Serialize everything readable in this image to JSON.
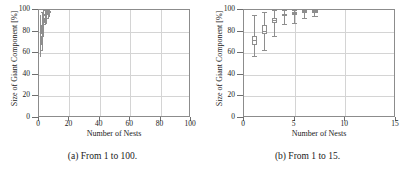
{
  "figure": {
    "panels": [
      {
        "id": "panel-a",
        "caption": "(a) From 1 to 100.",
        "chart_data": {
          "type": "box",
          "title": "",
          "xlabel": "Number of Nests",
          "ylabel": "Size of Giant Component [%]",
          "xlim": [
            0,
            100
          ],
          "ylim": [
            0,
            100
          ],
          "xticks": [
            0,
            20,
            40,
            60,
            80,
            100
          ],
          "xticklabels": [
            "0",
            "20",
            "40",
            "60",
            "80",
            "100"
          ],
          "yticks": [
            0,
            20,
            40,
            60,
            80,
            100
          ],
          "yticklabels": [
            "0",
            "20",
            "40",
            "60",
            "80",
            "100"
          ],
          "grid": true,
          "legend": "none",
          "boxes": [
            {
              "x": 1,
              "whisker_low": 57,
              "q1": 68,
              "median": 72,
              "q3": 76,
              "whisker_high": 95
            },
            {
              "x": 2,
              "whisker_low": 63,
              "q1": 78,
              "median": 81,
              "q3": 86,
              "whisker_high": 98
            },
            {
              "x": 3,
              "whisker_low": 76,
              "q1": 88,
              "median": 91,
              "q3": 93,
              "whisker_high": 100
            },
            {
              "x": 4,
              "whisker_low": 87,
              "q1": 94,
              "median": 95,
              "q3": 96,
              "whisker_high": 100
            },
            {
              "x": 5,
              "whisker_low": 88,
              "q1": 95,
              "median": 97,
              "q3": 98,
              "whisker_high": 100
            },
            {
              "x": 6,
              "whisker_low": 93,
              "q1": 97,
              "median": 98,
              "q3": 99,
              "whisker_high": 100
            },
            {
              "x": 7,
              "whisker_low": 94,
              "q1": 98,
              "median": 98,
              "q3": 99,
              "whisker_high": 100
            }
          ]
        }
      },
      {
        "id": "panel-b",
        "caption": "(b) From 1 to 15.",
        "chart_data": {
          "type": "box",
          "title": "",
          "xlabel": "Number of Nests",
          "ylabel": "Size of Giant Component [%]",
          "xlim": [
            0,
            15
          ],
          "ylim": [
            0,
            100
          ],
          "xticks": [
            0,
            5,
            10,
            15
          ],
          "xticklabels": [
            "0",
            "5",
            "10",
            "15"
          ],
          "yticks": [
            0,
            20,
            40,
            60,
            80,
            100
          ],
          "yticklabels": [
            "0",
            "20",
            "40",
            "60",
            "80",
            "100"
          ],
          "grid": true,
          "legend": "none",
          "boxes": [
            {
              "x": 1,
              "whisker_low": 57,
              "q1": 68,
              "median": 72,
              "q3": 76,
              "whisker_high": 95
            },
            {
              "x": 2,
              "whisker_low": 63,
              "q1": 78,
              "median": 81,
              "q3": 86,
              "whisker_high": 98
            },
            {
              "x": 3,
              "whisker_low": 76,
              "q1": 88,
              "median": 91,
              "q3": 93,
              "whisker_high": 100
            },
            {
              "x": 4,
              "whisker_low": 87,
              "q1": 94,
              "median": 95,
              "q3": 96,
              "whisker_high": 100
            },
            {
              "x": 5,
              "whisker_low": 88,
              "q1": 95,
              "median": 97,
              "q3": 98,
              "whisker_high": 100
            },
            {
              "x": 6,
              "whisker_low": 93,
              "q1": 97,
              "median": 98,
              "q3": 99,
              "whisker_high": 100
            },
            {
              "x": 7,
              "whisker_low": 94,
              "q1": 98,
              "median": 98,
              "q3": 99,
              "whisker_high": 100
            }
          ]
        }
      }
    ],
    "style": {
      "box_color": "#8e8e8e",
      "grid_color": "#d4d4d4",
      "frame_color": "#8c8c8c",
      "text_color": "#1a1a1a",
      "background": "#ffffff"
    }
  }
}
